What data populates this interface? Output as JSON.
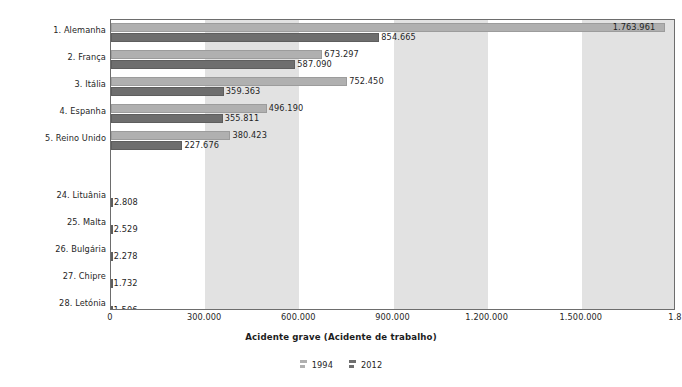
{
  "chart_data": {
    "type": "bar",
    "orientation": "horizontal",
    "title": "",
    "xlabel": "Acidente grave (Acidente de trabalho)",
    "ylabel": "",
    "xlim": [
      0,
      1800000
    ],
    "grid": false,
    "bands": true,
    "legend_position": "bottom",
    "categories": [
      "1. Alemanha",
      "2. França",
      "3. Itália",
      "4. Espanha",
      "5. Reino Unido",
      "24. Lituânia",
      "25. Malta",
      "26. Bulgária",
      "27. Chipre",
      "28. Letónia"
    ],
    "series": [
      {
        "name": "1994",
        "color": "#b0b0b0",
        "values": [
          1763961,
          673297,
          752450,
          496190,
          380423,
          null,
          null,
          null,
          null,
          null
        ],
        "labels": [
          "1.763.961",
          "673.297",
          "752.450",
          "496.190",
          "380.423",
          "",
          "",
          "",
          "",
          ""
        ]
      },
      {
        "name": "2012",
        "color": "#6e6e6e",
        "values": [
          854665,
          587090,
          359363,
          355811,
          227676,
          2808,
          2529,
          2278,
          1732,
          1506
        ],
        "labels": [
          "854.665",
          "587.090",
          "359.363",
          "355.811",
          "227.676",
          "2.808",
          "2.529",
          "2.278",
          "1.732",
          "1.506"
        ]
      }
    ],
    "xticks": [
      0,
      300000,
      600000,
      900000,
      1200000,
      1500000,
      1800000
    ],
    "xtick_labels": [
      "0",
      "300.000",
      "600.000",
      "900.000",
      "1.200.000",
      "1.500.000",
      "1.8"
    ]
  },
  "legend": {
    "items": [
      {
        "label": "1994",
        "color": "#b0b0b0"
      },
      {
        "label": "2012",
        "color": "#6e6e6e"
      }
    ]
  }
}
